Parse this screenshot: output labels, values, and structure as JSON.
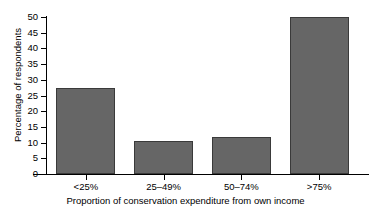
{
  "chart_data": {
    "type": "bar",
    "title": "self-generated income",
    "title_clipped_note": "top title line is cut off at the image edge",
    "categories": [
      "<25%",
      "25–49%",
      "50–74%",
      ">75%"
    ],
    "values": [
      27.5,
      10.4,
      11.8,
      50
    ],
    "xlabel": "Proportion of conservation expenditure from own income",
    "ylabel": "Percentage of respondents",
    "ylim": [
      0,
      50
    ],
    "ytick_labels": [
      "0",
      "5",
      "10",
      "15",
      "20",
      "25",
      "30",
      "35",
      "40",
      "45",
      "50"
    ],
    "ytick_values": [
      0,
      5,
      10,
      15,
      20,
      25,
      30,
      35,
      40,
      45,
      50
    ],
    "grid": false,
    "legend": false,
    "bar_color": "#666666",
    "bar_edge_color": "#3a3a3a",
    "axis_color": "#000000",
    "background": "#ffffff"
  }
}
